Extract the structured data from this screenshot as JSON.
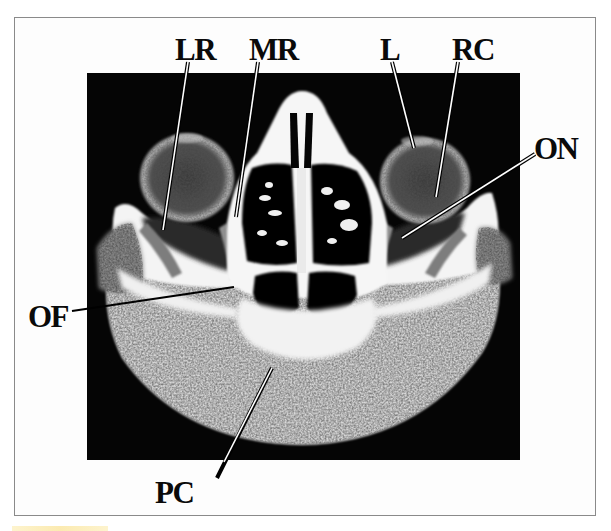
{
  "figure": {
    "type": "axial CT scan of orbits with anatomical labels",
    "frame_color": "#8a8a8a",
    "background_color": "#ffffff",
    "scan_background": "#050505"
  },
  "labels": [
    {
      "id": "LR",
      "text": "LR",
      "x": 175,
      "y": 34,
      "line": {
        "x1": 188,
        "y1": 62,
        "x2": 163,
        "y2": 230
      }
    },
    {
      "id": "MR",
      "text": "MR",
      "x": 249,
      "y": 34,
      "line": {
        "x1": 258,
        "y1": 62,
        "x2": 236,
        "y2": 217
      }
    },
    {
      "id": "L",
      "text": "L",
      "x": 380,
      "y": 34,
      "line": {
        "x1": 392,
        "y1": 62,
        "x2": 414,
        "y2": 148
      }
    },
    {
      "id": "RC",
      "text": "RC",
      "x": 452,
      "y": 34,
      "line": {
        "x1": 458,
        "y1": 62,
        "x2": 436,
        "y2": 197
      }
    },
    {
      "id": "ON",
      "text": "ON",
      "x": 534,
      "y": 133,
      "line": {
        "x1": 535,
        "y1": 154,
        "x2": 402,
        "y2": 238
      }
    },
    {
      "id": "OF",
      "text": "OF",
      "x": 28,
      "y": 301,
      "line": {
        "x1": 72,
        "y1": 311,
        "x2": 234,
        "y2": 287
      }
    },
    {
      "id": "PC",
      "text": "PC",
      "x": 155,
      "y": 477,
      "line": {
        "x1": 272,
        "y1": 368,
        "x2": 217,
        "y2": 478
      }
    }
  ]
}
